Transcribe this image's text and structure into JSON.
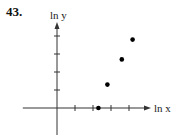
{
  "problem_number": "43.",
  "chart_data": {
    "type": "scatter",
    "title": "",
    "xlabel": "ln x",
    "ylabel": "ln y",
    "x_ticks": [
      1,
      2,
      3,
      4
    ],
    "y_ticks": [
      1,
      2,
      3,
      4
    ],
    "tick_labels_shown": false,
    "grid": false,
    "legend": null,
    "points": [
      {
        "x": 2.3,
        "y": 0.0
      },
      {
        "x": 2.8,
        "y": 1.3
      },
      {
        "x": 3.6,
        "y": 2.7
      },
      {
        "x": 4.2,
        "y": 3.8
      }
    ],
    "xlim": [
      -1.9,
      5.1
    ],
    "ylim": [
      -1.5,
      4.3
    ],
    "colors": {
      "axis": "#333333",
      "point": "#000000"
    }
  }
}
